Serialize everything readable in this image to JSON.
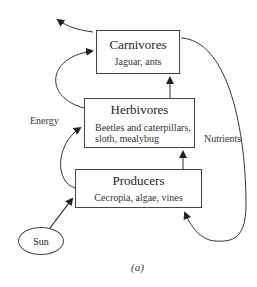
{
  "diagram": {
    "nodes": {
      "carnivores": {
        "title": "Carnivores",
        "examples": "Jaguar,  ants"
      },
      "herbivores": {
        "title": "Herbivores",
        "examples_line1": "Beetles and caterpillars,",
        "examples_line2": "sloth,  mealybug"
      },
      "producers": {
        "title": "Producers",
        "examples": "Cecropia,  algae, vines"
      },
      "sun": {
        "label": "Sun"
      }
    },
    "edge_labels": {
      "energy": "Energy",
      "nutrients": "Nutrients"
    },
    "edges": [
      {
        "from": "Sun",
        "to": "Producers"
      },
      {
        "from": "Producers",
        "to": "Herbivores",
        "type": "energy"
      },
      {
        "from": "Herbivores",
        "to": "Carnivores",
        "type": "energy"
      },
      {
        "from": "Producers",
        "to": "Herbivores",
        "type": "straight"
      },
      {
        "from": "Herbivores",
        "to": "Carnivores",
        "type": "straight"
      },
      {
        "from": "Carnivores",
        "to": "out",
        "type": "energy loss"
      },
      {
        "from": "Carnivores",
        "to": "Producers",
        "type": "nutrients"
      }
    ],
    "caption": "(a)"
  }
}
